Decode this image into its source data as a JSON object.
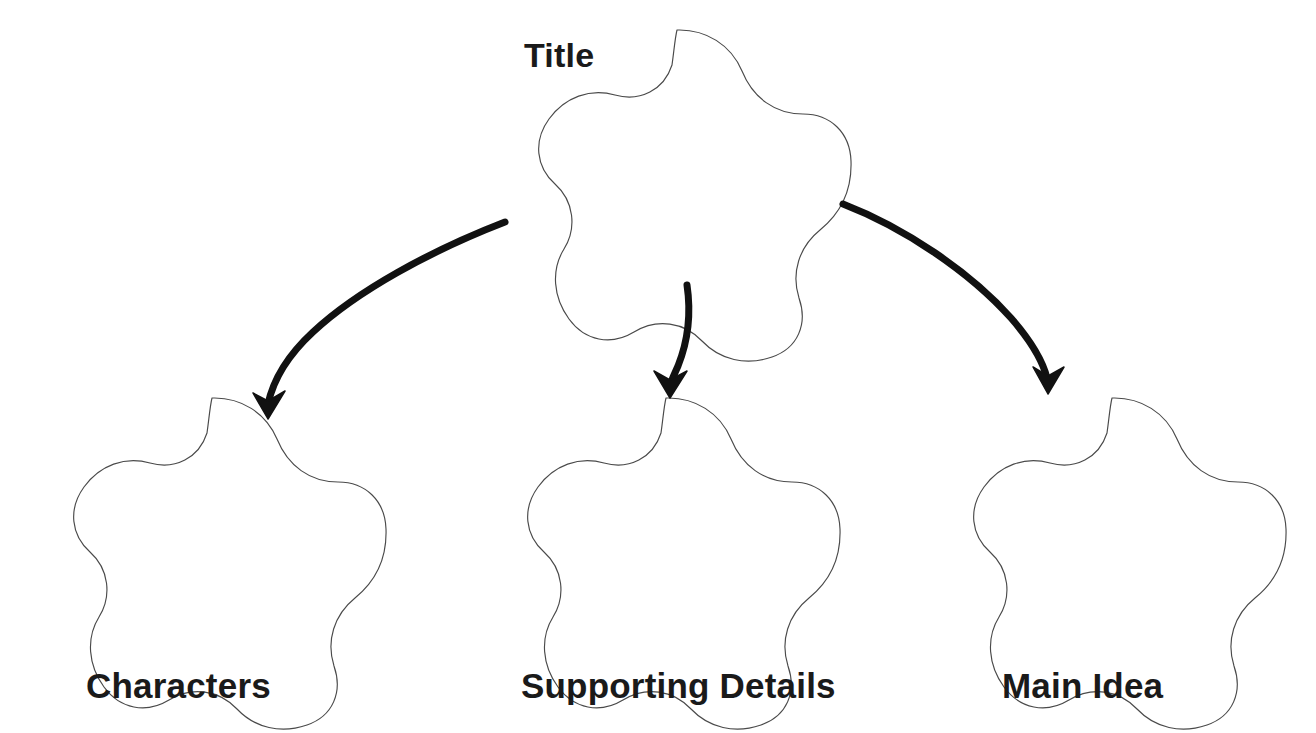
{
  "document": {
    "type": "graphic-organizer",
    "background_color": "#ffffff"
  },
  "diagram": {
    "outline_color": "#4a4a4a",
    "arrow_color": "#111111",
    "text_color": "#1a1a1a",
    "root": {
      "label": "Title",
      "shape": "five-lobed-flower",
      "label_position": "top-left-outside"
    },
    "children": [
      {
        "label": "Characters",
        "shape": "five-lobed-flower",
        "label_position": "below"
      },
      {
        "label": "Supporting Details",
        "shape": "five-lobed-flower",
        "label_position": "below"
      },
      {
        "label": "Main Idea",
        "shape": "five-lobed-flower",
        "label_position": "below"
      }
    ],
    "connectors": [
      {
        "from": "Title",
        "to": "Characters",
        "style": "curved-arrow",
        "direction": "down-left"
      },
      {
        "from": "Title",
        "to": "Supporting Details",
        "style": "curved-arrow",
        "direction": "down"
      },
      {
        "from": "Title",
        "to": "Main Idea",
        "style": "curved-arrow",
        "direction": "down-right"
      }
    ]
  }
}
